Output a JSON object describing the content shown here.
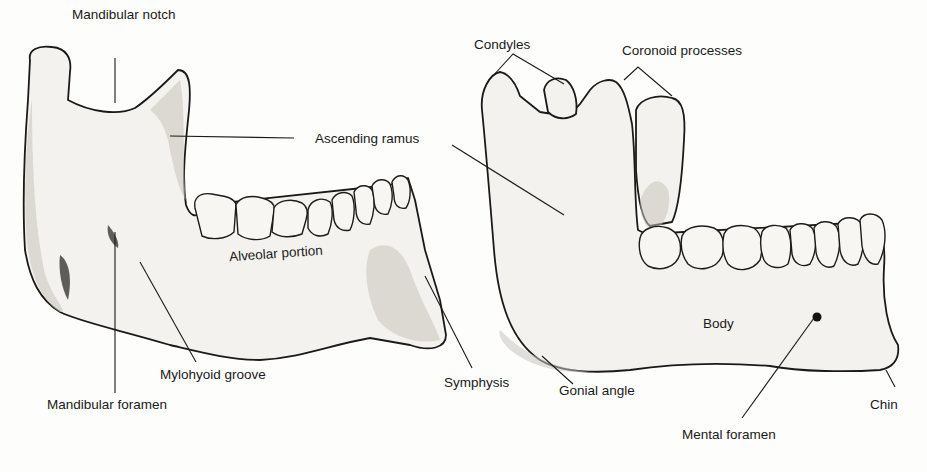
{
  "figure": {
    "background": "#fdfdfc",
    "ink_color": "#1a1a1a",
    "panels": [
      {
        "id": "left",
        "view": "medial view of mandible half"
      },
      {
        "id": "right",
        "view": "lateral view of mandible"
      }
    ]
  },
  "labels": {
    "mandibular_notch": "Mandibular notch",
    "ascending_ramus": "Ascending ramus",
    "alveolar_portion": "Alveolar portion",
    "mylohyoid_groove": "Mylohyoid groove",
    "mandibular_foramen": "Mandibular foramen",
    "symphysis": "Symphysis",
    "condyles": "Condyles",
    "coronoid_processes": "Coronoid processes",
    "gonial_angle": "Gonial angle",
    "body": "Body",
    "mental_foramen": "Mental foramen",
    "chin": "Chin"
  },
  "label_positions": {
    "mandibular_notch": [
      72,
      8
    ],
    "ascending_ramus": [
      315,
      132
    ],
    "alveolar_portion": [
      229,
      247
    ],
    "mylohyoid_groove": [
      160,
      368
    ],
    "mandibular_foramen": [
      47,
      398
    ],
    "symphysis": [
      444,
      376
    ],
    "condyles": [
      474,
      38
    ],
    "coronoid_processes": [
      622,
      44
    ],
    "gonial_angle": [
      559,
      384
    ],
    "body": [
      703,
      317
    ],
    "mental_foramen": [
      682,
      428
    ],
    "chin": [
      870,
      398
    ]
  },
  "leader_lines": [
    {
      "target": "mandibular_notch",
      "points": [
        [
          115,
          58
        ],
        [
          115,
          103
        ]
      ]
    },
    {
      "target": "ascending_ramus",
      "points": [
        [
          294,
          138
        ],
        [
          170,
          136
        ]
      ]
    },
    {
      "target": "ascending_ramus_right",
      "points": [
        [
          452,
          145
        ],
        [
          564,
          215
        ]
      ]
    },
    {
      "target": "mylohyoid_groove",
      "points": [
        [
          196,
          362
        ],
        [
          140,
          262
        ]
      ]
    },
    {
      "target": "mandibular_foramen",
      "points": [
        [
          115,
          393
        ],
        [
          115,
          232
        ]
      ]
    },
    {
      "target": "symphysis",
      "points": [
        [
          472,
          368
        ],
        [
          425,
          276
        ]
      ]
    },
    {
      "target": "condyles",
      "points": [
        [
          513,
          54
        ],
        [
          491,
          78
        ]
      ]
    },
    {
      "target": "condyles_b",
      "points": [
        [
          513,
          54
        ],
        [
          564,
          84
        ]
      ]
    },
    {
      "target": "coronoid_processes",
      "points": [
        [
          638,
          67
        ],
        [
          624,
          80
        ]
      ]
    },
    {
      "target": "coronoid_processes_b",
      "points": [
        [
          638,
          67
        ],
        [
          672,
          96
        ]
      ]
    },
    {
      "target": "gonial_angle",
      "points": [
        [
          573,
          384
        ],
        [
          542,
          356
        ]
      ]
    },
    {
      "target": "mental_foramen",
      "points": [
        [
          742,
          418
        ],
        [
          814,
          318
        ]
      ]
    },
    {
      "target": "chin",
      "points": [
        [
          895,
          387
        ],
        [
          886,
          370
        ]
      ]
    }
  ]
}
